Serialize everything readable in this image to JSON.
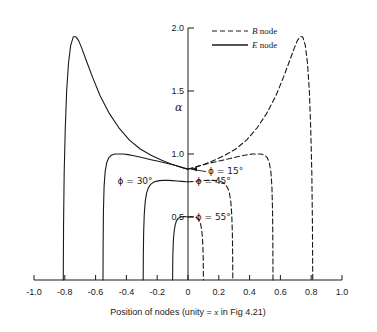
{
  "chart_data": {
    "type": "line",
    "title": "",
    "xlabel": "Position of nodes (unity = x in Fig 4.21)",
    "ylabel": "α",
    "xlim": [
      -1.0,
      1.0
    ],
    "ylim": [
      0.0,
      2.0
    ],
    "grid": false,
    "xticks": [
      "-1.0",
      "-0.8",
      "-0.6",
      "-0.4",
      "-0.2",
      "0",
      "0.2",
      "0.4",
      "0.6",
      "0.8",
      "1.0"
    ],
    "xtick_values": [
      -1.0,
      -0.8,
      -0.6,
      -0.4,
      -0.2,
      0.0,
      0.2,
      0.4,
      0.6,
      0.8,
      1.0
    ],
    "yticks": [
      "0.5",
      "1.0",
      "1.5",
      "2.0"
    ],
    "ytick_values": [
      0.5,
      1.0,
      1.5,
      2.0
    ],
    "legend_position": "top-right",
    "legend": [
      {
        "name": "B node",
        "style": "dashed",
        "symbol": "B",
        "suffix": " node"
      },
      {
        "name": "E node",
        "style": "solid",
        "symbol": "E",
        "suffix": " node"
      }
    ],
    "annotations": [
      {
        "text": "ϕ = 15°",
        "x": 0.13,
        "y": 0.86,
        "leader": true
      },
      {
        "text": "ϕ = 30°",
        "x": -0.23,
        "y": 0.78,
        "leader": false
      },
      {
        "text": "ϕ = 45°",
        "x": 0.05,
        "y": 0.78,
        "leader": false
      },
      {
        "text": "ϕ = 55°",
        "x": 0.05,
        "y": 0.49,
        "leader": false
      }
    ],
    "series": [
      {
        "name": "E node ϕ = 15°",
        "style": "solid",
        "phi": 15,
        "points": [
          [
            -0.81,
            0.0
          ],
          [
            -0.808,
            0.45
          ],
          [
            -0.804,
            0.85
          ],
          [
            -0.797,
            1.2
          ],
          [
            -0.788,
            1.5
          ],
          [
            -0.776,
            1.72
          ],
          [
            -0.762,
            1.86
          ],
          [
            -0.745,
            1.93
          ],
          [
            -0.728,
            1.93
          ],
          [
            -0.71,
            1.9
          ],
          [
            -0.69,
            1.84
          ],
          [
            -0.66,
            1.74
          ],
          [
            -0.62,
            1.61
          ],
          [
            -0.57,
            1.46
          ],
          [
            -0.51,
            1.32
          ],
          [
            -0.45,
            1.21
          ],
          [
            -0.38,
            1.11
          ],
          [
            -0.31,
            1.04
          ],
          [
            -0.24,
            0.99
          ],
          [
            -0.17,
            0.95
          ],
          [
            -0.11,
            0.92
          ],
          [
            -0.06,
            0.9
          ],
          [
            -0.02,
            0.885
          ],
          [
            0.0,
            0.88
          ]
        ]
      },
      {
        "name": "E node ϕ = 30°",
        "style": "solid",
        "phi": 30,
        "points": [
          [
            -0.552,
            0.0
          ],
          [
            -0.551,
            0.3
          ],
          [
            -0.549,
            0.55
          ],
          [
            -0.545,
            0.74
          ],
          [
            -0.538,
            0.86
          ],
          [
            -0.528,
            0.93
          ],
          [
            -0.515,
            0.97
          ],
          [
            -0.498,
            0.99
          ],
          [
            -0.475,
            1.0
          ],
          [
            -0.45,
            1.0
          ],
          [
            -0.42,
            1.0
          ],
          [
            -0.39,
            0.995
          ],
          [
            -0.36,
            0.988
          ],
          [
            -0.32,
            0.978
          ],
          [
            -0.28,
            0.966
          ],
          [
            -0.24,
            0.955
          ],
          [
            -0.2,
            0.944
          ],
          [
            -0.16,
            0.932
          ],
          [
            -0.12,
            0.921
          ],
          [
            -0.08,
            0.908
          ],
          [
            -0.04,
            0.894
          ],
          [
            0.0,
            0.88
          ]
        ]
      },
      {
        "name": "E node ϕ = 45°",
        "style": "solid",
        "phi": 45,
        "points": [
          [
            -0.291,
            0.0
          ],
          [
            -0.29,
            0.2
          ],
          [
            -0.288,
            0.38
          ],
          [
            -0.284,
            0.52
          ],
          [
            -0.278,
            0.62
          ],
          [
            -0.269,
            0.69
          ],
          [
            -0.258,
            0.73
          ],
          [
            -0.244,
            0.757
          ],
          [
            -0.228,
            0.773
          ],
          [
            -0.208,
            0.783
          ],
          [
            -0.185,
            0.789
          ],
          [
            -0.16,
            0.791
          ],
          [
            -0.13,
            0.791
          ],
          [
            -0.1,
            0.789
          ],
          [
            -0.07,
            0.786
          ],
          [
            -0.04,
            0.783
          ],
          [
            -0.02,
            0.781
          ],
          [
            0.0,
            0.78
          ]
        ]
      },
      {
        "name": "E node ϕ = 55°",
        "style": "solid",
        "phi": 55,
        "points": [
          [
            -0.1,
            0.0
          ],
          [
            -0.0995,
            0.1
          ],
          [
            -0.0985,
            0.19
          ],
          [
            -0.0965,
            0.27
          ],
          [
            -0.0935,
            0.34
          ],
          [
            -0.089,
            0.395
          ],
          [
            -0.083,
            0.438
          ],
          [
            -0.0755,
            0.468
          ],
          [
            -0.066,
            0.487
          ],
          [
            -0.054,
            0.497
          ],
          [
            -0.04,
            0.502
          ],
          [
            -0.025,
            0.503
          ],
          [
            -0.012,
            0.502
          ],
          [
            0.0,
            0.5
          ]
        ]
      },
      {
        "name": "B node ϕ = 15°",
        "style": "dashed",
        "phi": 15,
        "points": [
          [
            0.0,
            0.88
          ],
          [
            0.02,
            0.885
          ],
          [
            0.06,
            0.9
          ],
          [
            0.11,
            0.92
          ],
          [
            0.17,
            0.95
          ],
          [
            0.24,
            0.99
          ],
          [
            0.31,
            1.04
          ],
          [
            0.38,
            1.11
          ],
          [
            0.45,
            1.21
          ],
          [
            0.51,
            1.32
          ],
          [
            0.57,
            1.46
          ],
          [
            0.62,
            1.61
          ],
          [
            0.66,
            1.74
          ],
          [
            0.69,
            1.84
          ],
          [
            0.71,
            1.9
          ],
          [
            0.728,
            1.93
          ],
          [
            0.745,
            1.93
          ],
          [
            0.762,
            1.86
          ],
          [
            0.776,
            1.72
          ],
          [
            0.788,
            1.5
          ],
          [
            0.797,
            1.2
          ],
          [
            0.804,
            0.85
          ],
          [
            0.808,
            0.45
          ],
          [
            0.81,
            0.0
          ]
        ]
      },
      {
        "name": "B node ϕ = 30°",
        "style": "dashed",
        "phi": 30,
        "points": [
          [
            0.0,
            0.88
          ],
          [
            0.04,
            0.894
          ],
          [
            0.08,
            0.908
          ],
          [
            0.12,
            0.921
          ],
          [
            0.16,
            0.932
          ],
          [
            0.2,
            0.944
          ],
          [
            0.24,
            0.955
          ],
          [
            0.28,
            0.966
          ],
          [
            0.32,
            0.978
          ],
          [
            0.36,
            0.988
          ],
          [
            0.39,
            0.995
          ],
          [
            0.42,
            1.0
          ],
          [
            0.45,
            1.0
          ],
          [
            0.475,
            1.0
          ],
          [
            0.498,
            0.99
          ],
          [
            0.515,
            0.97
          ],
          [
            0.528,
            0.93
          ],
          [
            0.538,
            0.86
          ],
          [
            0.545,
            0.74
          ],
          [
            0.549,
            0.55
          ],
          [
            0.551,
            0.3
          ],
          [
            0.552,
            0.0
          ]
        ]
      },
      {
        "name": "B node ϕ = 45°",
        "style": "dashed",
        "phi": 45,
        "points": [
          [
            0.0,
            0.78
          ],
          [
            0.02,
            0.781
          ],
          [
            0.04,
            0.783
          ],
          [
            0.07,
            0.786
          ],
          [
            0.1,
            0.789
          ],
          [
            0.13,
            0.791
          ],
          [
            0.16,
            0.791
          ],
          [
            0.185,
            0.789
          ],
          [
            0.208,
            0.783
          ],
          [
            0.228,
            0.773
          ],
          [
            0.244,
            0.757
          ],
          [
            0.258,
            0.73
          ],
          [
            0.269,
            0.69
          ],
          [
            0.278,
            0.62
          ],
          [
            0.284,
            0.52
          ],
          [
            0.288,
            0.38
          ],
          [
            0.29,
            0.2
          ],
          [
            0.291,
            0.0
          ]
        ]
      },
      {
        "name": "B node ϕ = 55°",
        "style": "dashed",
        "phi": 55,
        "points": [
          [
            0.0,
            0.5
          ],
          [
            0.012,
            0.502
          ],
          [
            0.025,
            0.503
          ],
          [
            0.04,
            0.502
          ],
          [
            0.054,
            0.497
          ],
          [
            0.066,
            0.487
          ],
          [
            0.0755,
            0.468
          ],
          [
            0.083,
            0.438
          ],
          [
            0.089,
            0.395
          ],
          [
            0.0935,
            0.34
          ],
          [
            0.0965,
            0.27
          ],
          [
            0.0985,
            0.19
          ],
          [
            0.0995,
            0.1
          ],
          [
            0.1,
            0.0
          ]
        ]
      }
    ]
  },
  "colors": {
    "line": "#1a1a1a",
    "axis": "#1a1a1a",
    "background": "#ffffff"
  }
}
